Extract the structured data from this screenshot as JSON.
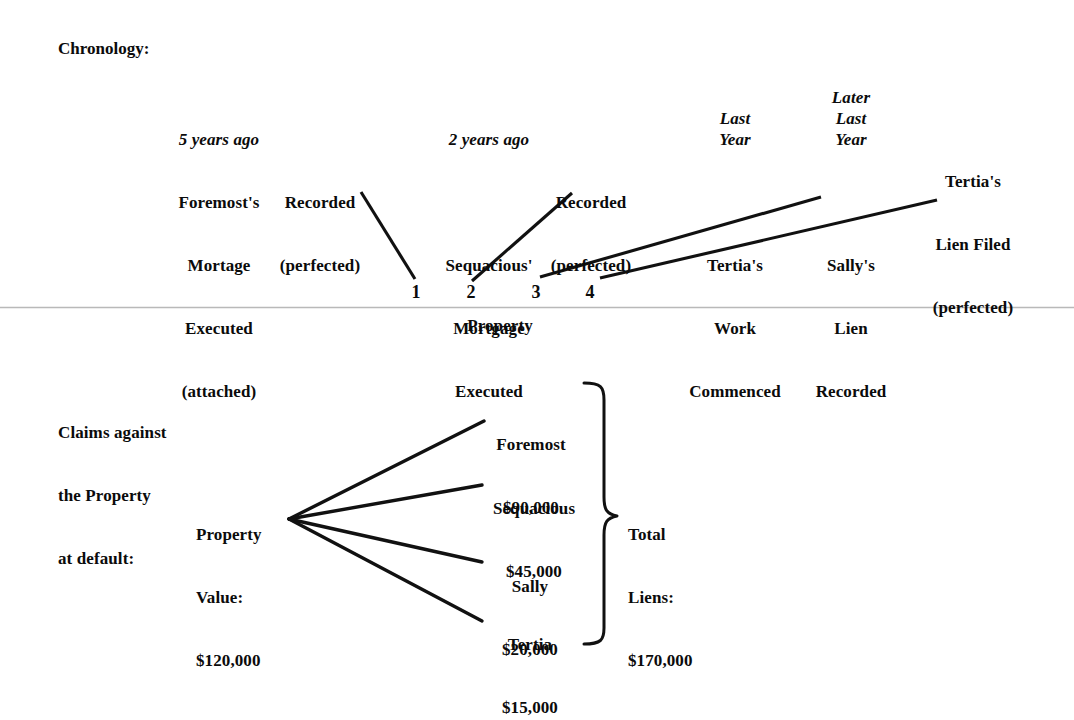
{
  "document": {
    "background_color": "#ffffff",
    "ink_color": "#111111",
    "rule_color": "#b9b9b9"
  },
  "chronology": {
    "section_label": "Chronology:",
    "events": [
      {
        "id": "foremost-mortgage-executed",
        "time_label": "5 years ago",
        "time_label_italic": true,
        "lines": [
          "Foremost's",
          "Mortage",
          "Executed",
          "(attached)"
        ]
      },
      {
        "id": "foremost-recorded",
        "time_label": "",
        "time_label_italic": false,
        "lines": [
          "Recorded",
          "(perfected)"
        ]
      },
      {
        "id": "sequacious-mortgage-executed",
        "time_label": "2 years ago",
        "time_label_italic": true,
        "lines": [
          "Sequacious'",
          "Mortgage",
          "Executed"
        ]
      },
      {
        "id": "sequacious-recorded",
        "time_label": "",
        "time_label_italic": false,
        "lines": [
          "Recorded",
          "(perfected)"
        ]
      },
      {
        "id": "tertia-work-commenced",
        "time_label": "Last\nYear",
        "time_label_italic": true,
        "lines": [
          "Tertia's",
          "Work",
          "Commenced"
        ]
      },
      {
        "id": "sally-lien-recorded",
        "time_label": "Later\nLast\nYear",
        "time_label_italic": true,
        "lines": [
          "Sally's",
          "Lien",
          "Recorded"
        ]
      },
      {
        "id": "tertia-lien-filed",
        "time_label": "",
        "time_label_italic": false,
        "lines": [
          "Tertia's",
          "Lien Filed",
          "(perfected)"
        ]
      }
    ],
    "timeline_markers": [
      "1",
      "2",
      "3",
      "4"
    ],
    "property_label": "Property"
  },
  "claims": {
    "heading_lines": [
      "Claims against",
      "the Property",
      "at default:"
    ],
    "property_value": {
      "label_lines": [
        "Property",
        "Value:"
      ],
      "amount": "$120,000"
    },
    "lienholders": [
      {
        "name": "Foremost",
        "amount": "$90,000"
      },
      {
        "name": "Sequacious",
        "amount": "$45,000"
      },
      {
        "name": "Sally",
        "amount": "$20,000"
      },
      {
        "name": "Tertia",
        "amount": "$15,000"
      }
    ],
    "total": {
      "label_lines": [
        "Total",
        "Liens:"
      ],
      "amount": "$170,000"
    }
  }
}
